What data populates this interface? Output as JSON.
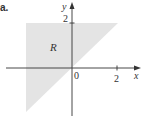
{
  "figure": {
    "problem_label": "a.",
    "region_label": "R",
    "x_axis_label": "x",
    "y_axis_label": "y",
    "origin_label": "0",
    "x_tick_label": "2",
    "y_tick_label": "2",
    "colors": {
      "region_fill": "#e4e4e4",
      "axis": "#333333",
      "text": "#333333"
    }
  }
}
